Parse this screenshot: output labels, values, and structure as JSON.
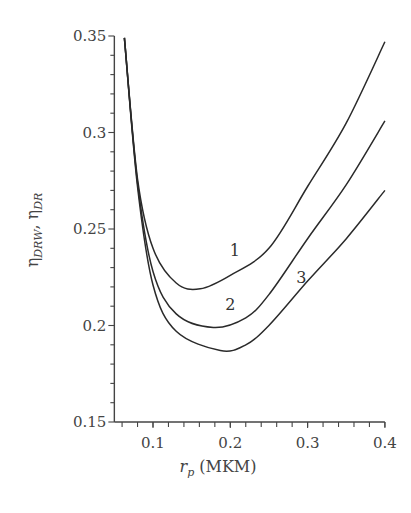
{
  "chart_data": {
    "type": "line",
    "title": "",
    "xlabel": "r_p (MKM)",
    "ylabel": "η_DRW, η_DR",
    "xlim": [
      0.05,
      0.4
    ],
    "ylim": [
      0.15,
      0.35
    ],
    "x_ticks": [
      0.1,
      0.2,
      0.3,
      0.4
    ],
    "x_tick_labels": [
      "0.1",
      "0.2",
      "0.3",
      "0.4"
    ],
    "y_ticks": [
      0.15,
      0.2,
      0.25,
      0.3,
      0.35
    ],
    "y_tick_labels": [
      "0.15",
      "0.2",
      "0.25",
      "0.3",
      "0.35"
    ],
    "grid": false,
    "legend": "none (curves labeled inline 1, 2, 3)",
    "series": [
      {
        "name": "1",
        "x": [
          0.063,
          0.08,
          0.1,
          0.13,
          0.161,
          0.2,
          0.25,
          0.3,
          0.35,
          0.4
        ],
        "y": [
          0.349,
          0.276,
          0.24,
          0.222,
          0.219,
          0.226,
          0.24,
          0.272,
          0.305,
          0.347
        ]
      },
      {
        "name": "2",
        "x": [
          0.063,
          0.08,
          0.1,
          0.13,
          0.178,
          0.22,
          0.25,
          0.3,
          0.35,
          0.4
        ],
        "y": [
          0.349,
          0.274,
          0.228,
          0.206,
          0.199,
          0.204,
          0.216,
          0.245,
          0.273,
          0.306
        ]
      },
      {
        "name": "3",
        "x": [
          0.063,
          0.08,
          0.1,
          0.13,
          0.187,
          0.22,
          0.25,
          0.3,
          0.35,
          0.4
        ],
        "y": [
          0.349,
          0.272,
          0.221,
          0.197,
          0.187,
          0.19,
          0.2,
          0.223,
          0.245,
          0.27
        ]
      }
    ],
    "annotations": [
      {
        "text": "1",
        "x": 0.206,
        "y": 0.236
      },
      {
        "text": "2",
        "x": 0.2,
        "y": 0.208
      },
      {
        "text": "3",
        "x": 0.292,
        "y": 0.222
      }
    ]
  },
  "labels": {
    "x_axis_main": "r",
    "x_axis_sub": "p",
    "x_axis_unit": " (MKM)",
    "y_axis_eta1": "η",
    "y_axis_sub1": "DRW",
    "y_axis_sep": ", ",
    "y_axis_eta2": "η",
    "y_axis_sub2": "DR"
  }
}
